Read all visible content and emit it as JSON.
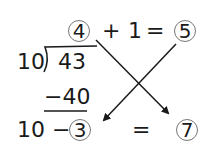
{
  "division": {
    "divisor": "10",
    "dividend": "43",
    "quotient": "4",
    "subtracted": "−40",
    "remainder_expr_prefix": "10 −",
    "remainder": "3"
  },
  "top_equation": {
    "plus": "+",
    "one": "1",
    "equals": "=",
    "result": "5"
  },
  "bottom_equation": {
    "equals": "=",
    "result": "7"
  },
  "arrows": [
    {
      "from": "4",
      "to": "7"
    },
    {
      "from": "5",
      "to": "3"
    }
  ]
}
